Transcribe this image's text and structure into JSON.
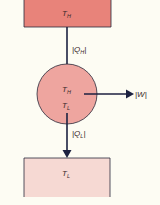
{
  "diagram": {
    "type": "heat-engine",
    "colors": {
      "background": "#fdfcf3",
      "hot_reservoir_fill": "#e8837a",
      "engine_fill": "#eea59f",
      "cold_reservoir_fill": "#f6d9d3",
      "stroke": "#2a2a3a",
      "arrow": "#1c2140"
    },
    "hot_reservoir": {
      "label_main": "T",
      "label_sub": "H"
    },
    "engine": {
      "label_top_main": "T",
      "label_top_sub": "H",
      "label_bottom_main": "T",
      "label_bottom_sub": "L"
    },
    "cold_reservoir": {
      "label_main": "T",
      "label_sub": "L"
    },
    "arrows": {
      "heat_in": {
        "label_open": "|Q",
        "label_sub": "H",
        "label_close": "|"
      },
      "work_out": {
        "label": "|W|"
      },
      "heat_out": {
        "label_open": "|Q",
        "label_sub": "L",
        "label_close": "|"
      }
    }
  }
}
